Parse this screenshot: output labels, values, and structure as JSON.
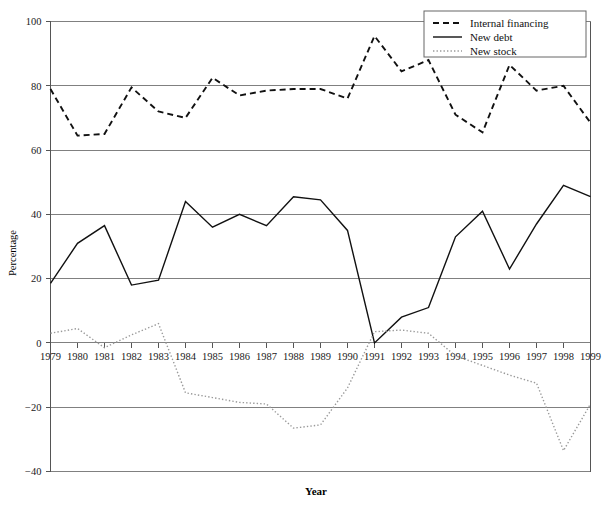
{
  "chart_data": {
    "type": "line",
    "title": "",
    "xlabel": "Year",
    "ylabel": "Percentage",
    "x": [
      1979,
      1980,
      1981,
      1982,
      1983,
      1984,
      1985,
      1986,
      1987,
      1988,
      1989,
      1990,
      1991,
      1992,
      1993,
      1994,
      1995,
      1996,
      1997,
      1998,
      1999
    ],
    "categories": [
      "1979",
      "1980",
      "1981",
      "1982",
      "1983",
      "1984",
      "1985",
      "1986",
      "1987",
      "1988",
      "1989",
      "1990",
      "1991",
      "1992",
      "1993",
      "1994",
      "1995",
      "1996",
      "1997",
      "1998",
      "1999"
    ],
    "xlim": [
      1979,
      1999
    ],
    "ylim": [
      -40,
      100
    ],
    "yticks": [
      -40,
      -20,
      0,
      20,
      40,
      60,
      80,
      100
    ],
    "ytick_labels": [
      "−40",
      "−20",
      "0",
      "20",
      "40",
      "60",
      "80",
      "100"
    ],
    "grid": true,
    "grid_axis": "y",
    "legend_position": "top-right",
    "series": [
      {
        "name": "Internal financing",
        "style": "dashed",
        "color": "#111111",
        "values": [
          79,
          64.5,
          65,
          79.5,
          72,
          70,
          82.5,
          77,
          78.5,
          79,
          79,
          76,
          95.5,
          84.5,
          88,
          71,
          65.5,
          86.5,
          78.5,
          80,
          68.5
        ]
      },
      {
        "name": "New debt",
        "style": "solid",
        "color": "#111111",
        "values": [
          18.5,
          31,
          36.5,
          18,
          19.5,
          44,
          36,
          40,
          36.5,
          45.5,
          44.5,
          35,
          0,
          8,
          11,
          33,
          41,
          23,
          37,
          49,
          45.5
        ]
      },
      {
        "name": "New stock",
        "style": "dotted",
        "color": "#9a9a9a",
        "values": [
          3,
          4.5,
          -1.5,
          2.5,
          6,
          -15.5,
          -17,
          -18.5,
          -19,
          -26.5,
          -25.5,
          -14,
          3.5,
          4,
          3,
          -4,
          -7,
          -10,
          -12.5,
          -33.5,
          -19
        ]
      }
    ],
    "legend": [
      {
        "label": "Internal financing",
        "style": "dashed"
      },
      {
        "label": "New debt",
        "style": "solid"
      },
      {
        "label": "New stock",
        "style": "dotted"
      }
    ]
  }
}
